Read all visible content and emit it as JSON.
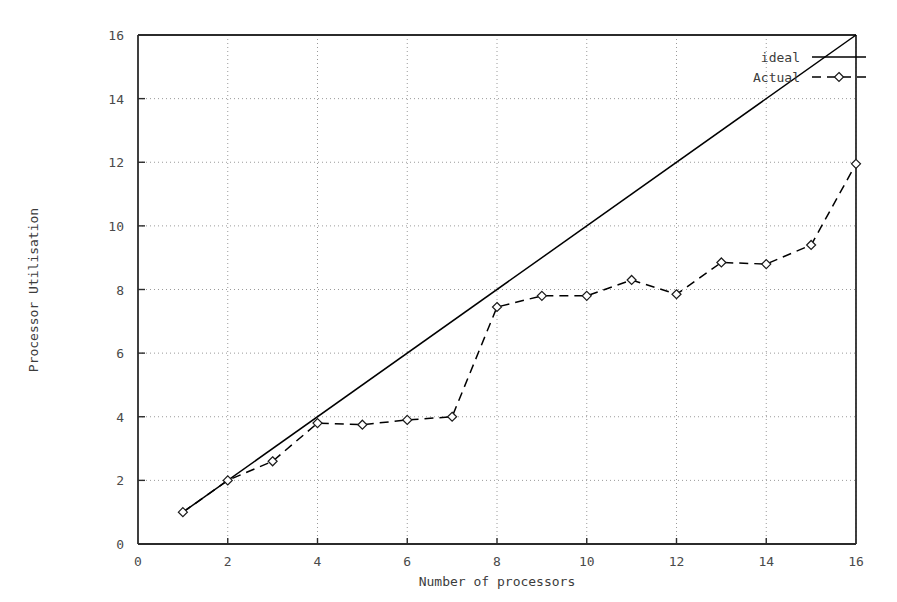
{
  "chart_data": {
    "type": "line",
    "title": "",
    "xlabel": "Number of processors",
    "ylabel": "Processor Utilisation",
    "xlim": [
      0,
      16
    ],
    "ylim": [
      0,
      16
    ],
    "xticks": [
      0,
      2,
      4,
      6,
      8,
      10,
      12,
      14,
      16
    ],
    "yticks": [
      0,
      2,
      4,
      6,
      8,
      10,
      12,
      14,
      16
    ],
    "xtick_labels": [
      "0",
      "2",
      "4",
      "6",
      "8",
      "10",
      "12",
      "14",
      "16"
    ],
    "ytick_labels": [
      "0",
      "2",
      "4",
      "6",
      "8",
      "10",
      "12",
      "14",
      "16"
    ],
    "grid": true,
    "grid_style": "dotted",
    "legend_position": "top-right",
    "series": [
      {
        "name": "ideal",
        "style": "solid",
        "marker": "none",
        "color": "#000000",
        "x": [
          1,
          16
        ],
        "values": [
          1,
          16
        ]
      },
      {
        "name": "Actual",
        "style": "dashed",
        "marker": "diamond",
        "color": "#000000",
        "x": [
          1,
          2,
          3,
          4,
          5,
          6,
          7,
          8,
          9,
          10,
          11,
          12,
          13,
          14,
          15,
          16
        ],
        "values": [
          1.0,
          2.0,
          2.6,
          3.8,
          3.75,
          3.9,
          4.0,
          7.45,
          7.8,
          7.8,
          8.3,
          7.85,
          8.85,
          8.8,
          9.4,
          11.95
        ]
      }
    ]
  },
  "legend": {
    "entries": [
      {
        "label": "ideal"
      },
      {
        "label": "Actual"
      }
    ]
  },
  "colors": {
    "axis": "#2b2b2b",
    "grid": "#9a9a9a",
    "line": "#1a1a1a",
    "text": "#3c3c3c",
    "background": "#ffffff"
  }
}
